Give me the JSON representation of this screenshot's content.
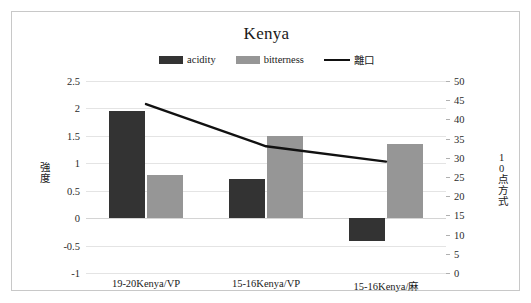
{
  "chart_data": {
    "type": "bar",
    "title": "Kenya",
    "categories": [
      "19-20Kenya/VP",
      "15-16Kenya/VP",
      "15-16Kenya/麻"
    ],
    "series": [
      {
        "name": "acidity",
        "type": "bar",
        "axis": "left",
        "color": "#333333",
        "values": [
          1.95,
          0.72,
          -0.42
        ]
      },
      {
        "name": "bitterness",
        "type": "bar",
        "axis": "left",
        "color": "#969696",
        "values": [
          0.78,
          1.5,
          1.35
        ]
      },
      {
        "name": "離口",
        "type": "line",
        "axis": "right",
        "color": "#111111",
        "values": [
          44,
          33,
          29
        ]
      }
    ],
    "xlabel": "",
    "ylabel": "強度",
    "y2label": "10点方式",
    "ylim": [
      -1,
      2.5
    ],
    "y2lim": [
      0,
      50
    ],
    "yticks": [
      "2.5",
      "2",
      "1.5",
      "1",
      "0.5",
      "0",
      "-0.5",
      "-1"
    ],
    "ytick_values": [
      2.5,
      2,
      1.5,
      1,
      0.5,
      0,
      -0.5,
      -1
    ],
    "y2ticks": [
      "50",
      "45",
      "40",
      "35",
      "30",
      "25",
      "20",
      "15",
      "10",
      "5",
      "0"
    ],
    "y2tick_values": [
      50,
      45,
      40,
      35,
      30,
      25,
      20,
      15,
      10,
      5,
      0
    ],
    "grid": true,
    "legend_position": "top",
    "legend": [
      {
        "label": "acidity",
        "marker": "swatch",
        "color": "#333333"
      },
      {
        "label": "bitterness",
        "marker": "swatch",
        "color": "#969696"
      },
      {
        "label": "離口",
        "marker": "line",
        "color": "#111111"
      }
    ]
  },
  "colors": {
    "acidity": "#333333",
    "bitterness": "#969696",
    "line": "#111111",
    "grid": "#e4e4e4",
    "frame": "#c8c8c8",
    "text": "#1a1a1a"
  }
}
